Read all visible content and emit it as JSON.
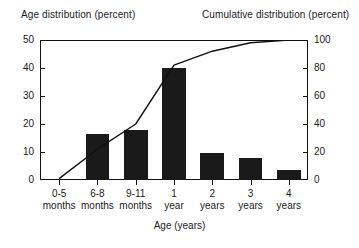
{
  "chart_data": {
    "type": "bar",
    "title": "",
    "left_axis_title": "Age distribution (percent)",
    "right_axis_title": "Cumulative distribution (percent)",
    "xlabel": "Age (years)",
    "ylabel": "Age distribution (percent)",
    "y2label": "Cumulative distribution (percent)",
    "ylim": [
      0,
      50
    ],
    "y2lim": [
      0,
      100
    ],
    "yticks": [
      0,
      10,
      20,
      30,
      40,
      50
    ],
    "y2ticks": [
      0,
      20,
      40,
      60,
      80,
      100
    ],
    "grid": false,
    "legend": "none",
    "categories": [
      "0-5 months",
      "6-8 months",
      "9-11 months",
      "1 year",
      "2 years",
      "3 years",
      "4 years"
    ],
    "category_lines": [
      [
        "0-5",
        "months"
      ],
      [
        "6-8",
        "months"
      ],
      [
        "9-11",
        "months"
      ],
      [
        "1",
        "year"
      ],
      [
        "2",
        "years"
      ],
      [
        "3",
        "years"
      ],
      [
        "4",
        "years"
      ]
    ],
    "series": [
      {
        "name": "Age distribution (percent)",
        "type": "bar",
        "axis": "left",
        "color": "#1a1a1a",
        "values": [
          0,
          16.5,
          18,
          40,
          9.5,
          8,
          3.5
        ]
      },
      {
        "name": "Cumulative distribution (percent)",
        "type": "line",
        "axis": "right",
        "color": "#111111",
        "values": [
          1,
          22,
          40,
          82,
          92,
          98,
          100
        ]
      }
    ]
  }
}
